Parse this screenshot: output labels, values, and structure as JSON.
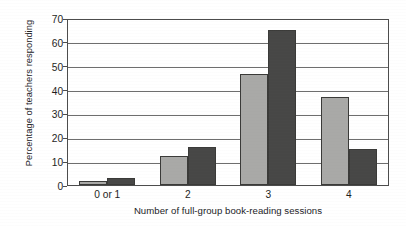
{
  "chart_data": {
    "type": "bar",
    "title": "",
    "subtitle": "",
    "xlabel": "Number of full-group book-reading sessions",
    "ylabel": "Percentage of teachers responding",
    "categories": [
      "0 or 1",
      "2",
      "3",
      "4"
    ],
    "series": [
      {
        "name": "light-gray-series",
        "color": "#a9a9a7",
        "values": [
          1.5,
          12,
          46.5,
          37
        ]
      },
      {
        "name": "dark-gray-series",
        "color": "#474746",
        "values": [
          3,
          16,
          65,
          15
        ]
      }
    ],
    "ylim": [
      0,
      70
    ],
    "y_ticks": [
      0,
      10,
      20,
      30,
      40,
      50,
      60,
      70
    ],
    "y_tick_labels": [
      "0",
      "10",
      "20",
      "30",
      "40",
      "50",
      "60",
      "70"
    ],
    "grid": true,
    "grid_axis": "y",
    "legend": false,
    "legend_position": "none",
    "frame": true,
    "background": "#ffffff",
    "axis_color": "#4c4c4c",
    "grid_color": "#6e6e6e",
    "text_color": "#1e1e1c"
  }
}
